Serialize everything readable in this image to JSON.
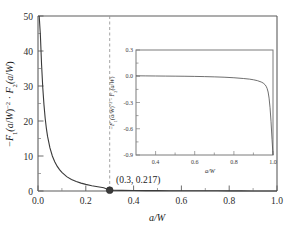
{
  "figure": {
    "background_color": "#ffffff",
    "axis_color": "#5d5d5d",
    "curve_color": "#3a3a3a",
    "guide_color": "#9a9a9a"
  },
  "chart_data": {
    "type": "line",
    "title": "",
    "xlabel": "a/W",
    "ylabel": "-F1(a/W)^-2 . F2(a/W)",
    "ylabel_parts": {
      "minus": "−",
      "f1": "F",
      "f1_sub": "1",
      "arg": "(a/W)",
      "exp": "−2",
      "dot": "·",
      "f2": "F",
      "f2_sub": "2"
    },
    "xlim": [
      0.0,
      1.0
    ],
    "ylim": [
      0.0,
      50.0
    ],
    "xticks": [
      "0.0",
      "0.2",
      "0.4",
      "0.6",
      "0.8",
      "1.0"
    ],
    "xtick_values": [
      0.0,
      0.2,
      0.4,
      0.6,
      0.8,
      1.0
    ],
    "yticks": [
      "0",
      "10",
      "20",
      "30",
      "40",
      "50"
    ],
    "ytick_values": [
      0,
      10,
      20,
      30,
      40,
      50
    ],
    "grid": false,
    "legend": "none",
    "series": [
      {
        "name": "-F1^-2 F2",
        "x": [
          0.005,
          0.01,
          0.015,
          0.02,
          0.025,
          0.03,
          0.035,
          0.04,
          0.05,
          0.06,
          0.07,
          0.08,
          0.09,
          0.1,
          0.12,
          0.14,
          0.16,
          0.18,
          0.2,
          0.225,
          0.25,
          0.275,
          0.3,
          0.35,
          0.4,
          0.45,
          0.5,
          0.55,
          0.6,
          0.65,
          0.7,
          0.75,
          0.8,
          0.85,
          0.9,
          0.95,
          1.0
        ],
        "y": [
          50.0,
          44.5,
          36.0,
          29.5,
          24.6,
          20.8,
          17.9,
          15.6,
          12.3,
          10.0,
          8.35,
          7.1,
          6.1,
          5.3,
          4.1,
          3.3,
          2.7,
          2.25,
          1.9,
          1.52,
          1.22,
          0.95,
          0.217,
          0.17,
          0.14,
          0.12,
          0.1,
          0.09,
          0.08,
          0.07,
          0.06,
          0.05,
          0.04,
          0.03,
          0.02,
          0.01,
          0.0
        ]
      }
    ],
    "annotations": [
      {
        "text": "(0.3, 0.217)",
        "x": 0.3,
        "y": 0.217,
        "marker": true
      }
    ],
    "guide_lines": [
      {
        "orientation": "vertical",
        "x": 0.3,
        "style": "dashed"
      }
    ],
    "inset": {
      "type": "line",
      "xlabel": "a/W",
      "ylabel": "-F1(a/W)^-2 . F2(a/W)",
      "xlim": [
        0.3,
        1.0
      ],
      "ylim": [
        -0.9,
        0.3
      ],
      "xticks": [
        "0.4",
        "0.6",
        "0.8",
        "1.0"
      ],
      "xtick_values": [
        0.4,
        0.6,
        0.8,
        1.0
      ],
      "yticks": [
        "0.3",
        "0.0",
        "-0.3",
        "-0.6",
        "-0.9"
      ],
      "ytick_values": [
        0.3,
        0.0,
        -0.3,
        -0.6,
        -0.9
      ],
      "grid": false,
      "series": [
        {
          "name": "-F1^-2 F2 (zoom)",
          "x": [
            0.3,
            0.35,
            0.4,
            0.45,
            0.5,
            0.55,
            0.6,
            0.65,
            0.7,
            0.75,
            0.8,
            0.85,
            0.88,
            0.9,
            0.92,
            0.94,
            0.95,
            0.96,
            0.965,
            0.97,
            0.975,
            0.98,
            0.985,
            0.99,
            0.995,
            1.0
          ],
          "y": [
            0.005,
            0.004,
            0.003,
            0.002,
            0.001,
            0.0,
            -0.002,
            -0.004,
            -0.007,
            -0.011,
            -0.017,
            -0.026,
            -0.033,
            -0.04,
            -0.05,
            -0.066,
            -0.078,
            -0.098,
            -0.115,
            -0.14,
            -0.18,
            -0.25,
            -0.36,
            -0.52,
            -0.72,
            -0.92
          ]
        }
      ]
    }
  }
}
